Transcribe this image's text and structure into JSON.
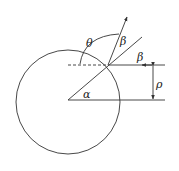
{
  "diagram": {
    "title": "",
    "labels": {
      "theta": "θ",
      "beta_refracted": "β",
      "beta_incident": "β",
      "rho": "ρ",
      "alpha": "α"
    },
    "colors": {
      "stroke": "#333333",
      "text": "#222222",
      "background": "#ffffff"
    }
  }
}
